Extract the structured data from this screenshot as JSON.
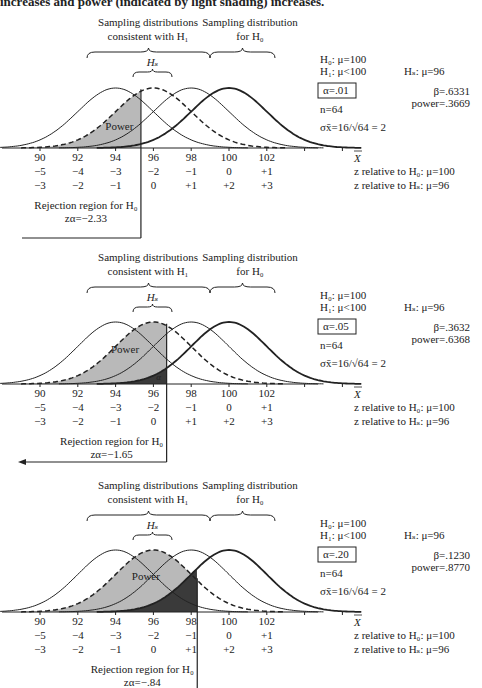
{
  "caption": "increases and power (indicated by light shading) increases.",
  "chart_data": [
    {
      "type": "line",
      "title": "Sampling distributions, alpha = .01",
      "xlabel": "X̄",
      "x_ticks": [
        90,
        92,
        94,
        96,
        98,
        100,
        102
      ],
      "z_h0_ticks": [
        "−5",
        "−4",
        "−3",
        "−2",
        "−1",
        "0",
        "+1"
      ],
      "z_hs_ticks": [
        "−3",
        "−2",
        "−1",
        "0",
        "+1",
        "+2",
        "+3"
      ],
      "z_h0_label": "z relative to H₀: μ=100",
      "z_hs_label": "z relative to Hₛ: μ=96",
      "xlim": [
        88,
        106
      ],
      "brace_h1_label_1": "Sampling distributions",
      "brace_h1_label_2": "consistent with H₁",
      "brace_h0_label_1": "Sampling distribution",
      "brace_h0_label_2": "for H₀",
      "hs_label": "Hₛ",
      "series": [
        {
          "name": "H1 mu=94",
          "mean": 94,
          "sd": 2,
          "style": "solid"
        },
        {
          "name": "Hs mu=96",
          "mean": 96,
          "sd": 2,
          "style": "dashed"
        },
        {
          "name": "H1 mu=98",
          "mean": 98,
          "sd": 2,
          "style": "solid"
        },
        {
          "name": "H0 mu=100",
          "mean": 100,
          "sd": 2,
          "style": "bold"
        }
      ],
      "critical_value": 95.34,
      "alpha_shade": false,
      "power_label": "Power",
      "alpha_label": "",
      "h0": "H₀: μ=100",
      "h1": "H₁: μ<100",
      "hs": "Hₛ: μ=96",
      "alpha": "α=.01",
      "beta": "β=.6331",
      "power": "power=.3669",
      "n": "n=64",
      "sigma": "σx̄=16/√64 = 2",
      "rejection_label": "Rejection region for H₀",
      "z_alpha": "zα=−2.33",
      "rejection_style": "box"
    },
    {
      "type": "line",
      "title": "Sampling distributions, alpha = .05",
      "xlabel": "X̄",
      "x_ticks": [
        90,
        92,
        94,
        96,
        98,
        100,
        102
      ],
      "z_h0_ticks": [
        "−5",
        "−4",
        "−3",
        "−2",
        "−1",
        "0",
        "+1"
      ],
      "z_hs_ticks": [
        "−3",
        "−2",
        "−1",
        "0",
        "+1",
        "+2",
        "+3"
      ],
      "z_h0_label": "z relative to H₀: μ=100",
      "z_hs_label": "z relative to Hₛ: μ=96",
      "xlim": [
        88,
        106
      ],
      "brace_h1_label_1": "Sampling distributions",
      "brace_h1_label_2": "consistent with H₁",
      "brace_h0_label_1": "Sampling distribution",
      "brace_h0_label_2": "for H₀",
      "hs_label": "Hₛ",
      "series": [
        {
          "name": "H1 mu=94",
          "mean": 94,
          "sd": 2,
          "style": "solid"
        },
        {
          "name": "Hs mu=96",
          "mean": 96,
          "sd": 2,
          "style": "dashed"
        },
        {
          "name": "H1 mu=98",
          "mean": 98,
          "sd": 2,
          "style": "solid"
        },
        {
          "name": "H0 mu=100",
          "mean": 100,
          "sd": 2,
          "style": "bold"
        }
      ],
      "critical_value": 96.7,
      "alpha_shade": true,
      "power_label": "Power",
      "alpha_label": "α",
      "h0": "H₀: μ=100",
      "h1": "H₁: μ<100",
      "hs": "Hₛ: μ=96",
      "alpha": "α=.05",
      "beta": "β=.3632",
      "power": "power=.6368",
      "n": "n=64",
      "sigma": "σx̄=16/√64 = 2",
      "rejection_label": "Rejection region for H₀",
      "z_alpha": "zα=−1.65",
      "rejection_style": "arrow"
    },
    {
      "type": "line",
      "title": "Sampling distributions, alpha = .20",
      "xlabel": "X̄",
      "x_ticks": [
        90,
        92,
        94,
        96,
        98,
        100,
        102
      ],
      "z_h0_ticks": [
        "−5",
        "−4",
        "−3",
        "−2",
        "−1",
        "0",
        "+1"
      ],
      "z_hs_ticks": [
        "−3",
        "−2",
        "−1",
        "0",
        "+1",
        "+2",
        "+3"
      ],
      "z_h0_label": "z relative to H₀: μ=100",
      "z_hs_label": "z relative to Hₛ: μ=96",
      "xlim": [
        88,
        106
      ],
      "brace_h1_label_1": "Sampling distributions",
      "brace_h1_label_2": "consistent with H₁",
      "brace_h0_label_1": "Sampling distribution",
      "brace_h0_label_2": "for H₀",
      "hs_label": "Hₛ",
      "series": [
        {
          "name": "H1 mu=94",
          "mean": 94,
          "sd": 2,
          "style": "solid"
        },
        {
          "name": "Hs mu=96",
          "mean": 96,
          "sd": 2,
          "style": "dashed"
        },
        {
          "name": "H1 mu=98",
          "mean": 98,
          "sd": 2,
          "style": "solid"
        },
        {
          "name": "H0 mu=100",
          "mean": 100,
          "sd": 2,
          "style": "bold"
        }
      ],
      "critical_value": 98.32,
      "alpha_shade": true,
      "power_label": "Power",
      "alpha_label": "",
      "h0": "H₀: μ=100",
      "h1": "H₁: μ<100",
      "hs": "Hₛ: μ=96",
      "alpha": "α=.20",
      "beta": "β=.1230",
      "power": "power=.8770",
      "n": "n=64",
      "sigma": "σx̄=16/√64 = 2",
      "rejection_label": "Rejection region for H₀",
      "z_alpha": "zα=−.84",
      "rejection_style": "line"
    }
  ]
}
